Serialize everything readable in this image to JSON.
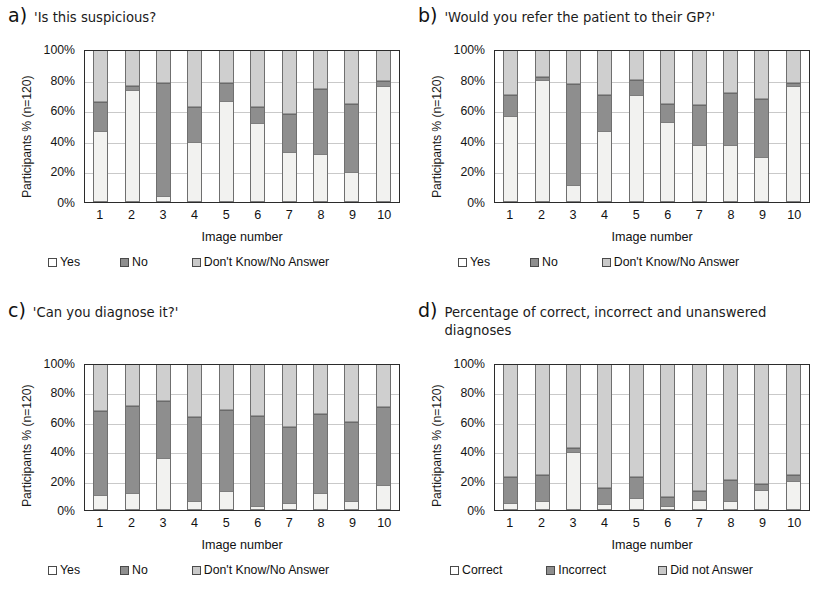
{
  "figure": {
    "y_axis_label": "Participants % (n=120)",
    "x_axis_label": "Image  number",
    "y_ticks": [
      "100%",
      "80%",
      "60%",
      "40%",
      "20%",
      "0%"
    ],
    "x_ticks": [
      "1",
      "2",
      "3",
      "4",
      "5",
      "6",
      "7",
      "8",
      "9",
      "10"
    ],
    "colors": {
      "series0": "#f2f2f0",
      "series1": "#8e8e8e",
      "series2": "#cfcfcf",
      "axis": "#2b2b2b",
      "grid": "#c9c9c9"
    }
  },
  "panels": [
    {
      "letter": "a)",
      "title": "'Is this suspicious?",
      "legend": [
        "Yes",
        "No",
        "Don't Know/No Answer"
      ]
    },
    {
      "letter": "b)",
      "title": "'Would you refer the patient to their GP?'",
      "legend": [
        "Yes",
        "No",
        "Don't Know/No Answer"
      ]
    },
    {
      "letter": "c)",
      "title": "'Can you diagnose it?'",
      "legend": [
        "Yes",
        "No",
        "Don't Know/No Answer"
      ]
    },
    {
      "letter": "d)",
      "title": "Percentage of correct, incorrect and unanswered diagnoses",
      "legend": [
        "Correct",
        "Incorrect",
        "Did not  Answer"
      ]
    }
  ],
  "chart_data": [
    {
      "type": "bar",
      "stacked": true,
      "panel": "a",
      "title": "'Is this suspicious?",
      "xlabel": "Image  number",
      "ylabel": "Participants % (n=120)",
      "ylim": [
        0,
        100
      ],
      "yticks": [
        0,
        20,
        40,
        60,
        80,
        100
      ],
      "grid": true,
      "legend_position": "below",
      "categories": [
        "1",
        "2",
        "3",
        "4",
        "5",
        "6",
        "7",
        "8",
        "9",
        "10"
      ],
      "series": [
        {
          "name": "Yes",
          "values": [
            47,
            74,
            4,
            40,
            67,
            52,
            33,
            32,
            20,
            77
          ]
        },
        {
          "name": "No",
          "values": [
            19,
            3,
            75,
            23,
            12,
            11,
            25,
            43,
            45,
            3
          ]
        },
        {
          "name": "Don't Know/No Answer",
          "values": [
            34,
            23,
            21,
            37,
            21,
            37,
            42,
            25,
            35,
            20
          ]
        }
      ]
    },
    {
      "type": "bar",
      "stacked": true,
      "panel": "b",
      "title": "'Would you refer the patient to their GP?'",
      "xlabel": "Image  number",
      "ylabel": "Participants % (n=120)",
      "ylim": [
        0,
        100
      ],
      "yticks": [
        0,
        20,
        40,
        60,
        80,
        100
      ],
      "grid": true,
      "legend_position": "below",
      "categories": [
        "1",
        "2",
        "3",
        "4",
        "5",
        "6",
        "7",
        "8",
        "9",
        "10"
      ],
      "series": [
        {
          "name": "Yes",
          "values": [
            57,
            81,
            11,
            47,
            71,
            53,
            38,
            38,
            30,
            77
          ]
        },
        {
          "name": "No",
          "values": [
            14,
            2,
            67,
            24,
            10,
            12,
            26,
            34,
            38,
            2
          ]
        },
        {
          "name": "Don't Know/No Answer",
          "values": [
            29,
            17,
            22,
            29,
            19,
            35,
            36,
            28,
            32,
            21
          ]
        }
      ]
    },
    {
      "type": "bar",
      "stacked": true,
      "panel": "c",
      "title": "'Can you diagnose it?'",
      "xlabel": "Image  number",
      "ylabel": "Participants % (n=120)",
      "ylim": [
        0,
        100
      ],
      "yticks": [
        0,
        20,
        40,
        60,
        80,
        100
      ],
      "grid": true,
      "legend_position": "below",
      "categories": [
        "1",
        "2",
        "3",
        "4",
        "5",
        "6",
        "7",
        "8",
        "9",
        "10"
      ],
      "series": [
        {
          "name": "Yes",
          "values": [
            10,
            12,
            36,
            6,
            13,
            3,
            5,
            12,
            6,
            17
          ]
        },
        {
          "name": "No",
          "values": [
            58,
            60,
            39,
            58,
            56,
            62,
            52,
            54,
            55,
            54
          ]
        },
        {
          "name": "Don't Know/No Answer",
          "values": [
            32,
            28,
            25,
            36,
            31,
            35,
            43,
            34,
            39,
            29
          ]
        }
      ]
    },
    {
      "type": "bar",
      "stacked": true,
      "panel": "d",
      "title": "Percentage of correct, incorrect and unanswered diagnoses",
      "xlabel": "Image  number",
      "ylabel": "Participants % (n=120)",
      "ylim": [
        0,
        100
      ],
      "yticks": [
        0,
        20,
        40,
        60,
        80,
        100
      ],
      "grid": true,
      "legend_position": "below",
      "categories": [
        "1",
        "2",
        "3",
        "4",
        "5",
        "6",
        "7",
        "8",
        "9",
        "10"
      ],
      "series": [
        {
          "name": "Correct",
          "values": [
            5,
            6,
            40,
            4,
            8,
            3,
            7,
            6,
            14,
            20
          ]
        },
        {
          "name": "Incorrect",
          "values": [
            18,
            18,
            3,
            11,
            15,
            6,
            6,
            15,
            4,
            4
          ]
        },
        {
          "name": "Did not  Answer",
          "values": [
            77,
            76,
            57,
            85,
            77,
            91,
            87,
            79,
            82,
            76
          ]
        }
      ]
    }
  ]
}
